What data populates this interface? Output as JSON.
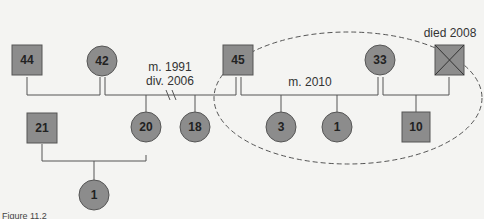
{
  "diagram": {
    "type": "genogram",
    "nodes": [
      {
        "id": "n44",
        "label": "44",
        "shape": "square"
      },
      {
        "id": "n42",
        "label": "42",
        "shape": "circle"
      },
      {
        "id": "n45",
        "label": "45",
        "shape": "square"
      },
      {
        "id": "n33",
        "label": "33",
        "shape": "circle"
      },
      {
        "id": "ndead",
        "label": "",
        "shape": "square-crossed"
      },
      {
        "id": "n21",
        "label": "21",
        "shape": "square"
      },
      {
        "id": "n20",
        "label": "20",
        "shape": "circle"
      },
      {
        "id": "n18",
        "label": "18",
        "shape": "circle"
      },
      {
        "id": "n3",
        "label": "3",
        "shape": "circle"
      },
      {
        "id": "n1a",
        "label": "1",
        "shape": "circle"
      },
      {
        "id": "n10",
        "label": "10",
        "shape": "square"
      },
      {
        "id": "n1b",
        "label": "1",
        "shape": "circle"
      }
    ],
    "annotations": {
      "marriage1": "m. 1991",
      "divorce1": "div. 2006",
      "marriage2": "m. 2010",
      "died": "died 2008"
    },
    "caption": "Figure 11.2"
  },
  "colors": {
    "fill": "#8c8c8c",
    "stroke": "#555555",
    "line": "#555555",
    "dashed": "#555555"
  }
}
